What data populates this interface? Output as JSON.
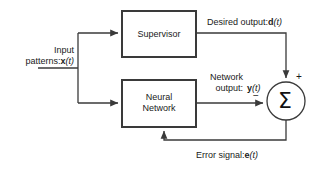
{
  "diagram": {
    "type": "block-diagram",
    "colors": {
      "line": "#3a3a3a",
      "text": "#1a1a1a",
      "background": "#ffffff"
    },
    "blocks": [
      {
        "id": "supervisor",
        "label": "Supervisor",
        "shape": "rectangle"
      },
      {
        "id": "neural-network",
        "label_line1": "Neural",
        "label_line2": "Network",
        "shape": "rectangle"
      },
      {
        "id": "summing-junction",
        "label": "Σ",
        "shape": "circle",
        "plus_sign": "+",
        "minus_sign": "−"
      }
    ],
    "signals": {
      "input": {
        "line1": "Input",
        "line2_prefix": "patterns:",
        "symbol": "x",
        "arg": "(t)"
      },
      "desired_output": {
        "prefix": "Desired output:",
        "symbol": "d",
        "arg": "(t)"
      },
      "network_output": {
        "line1": "Network",
        "line2_prefix": "output:",
        "symbol": "y",
        "arg": "(t)"
      },
      "error_signal": {
        "prefix": "Error signal:",
        "symbol": "e",
        "arg": "(t)"
      }
    }
  }
}
